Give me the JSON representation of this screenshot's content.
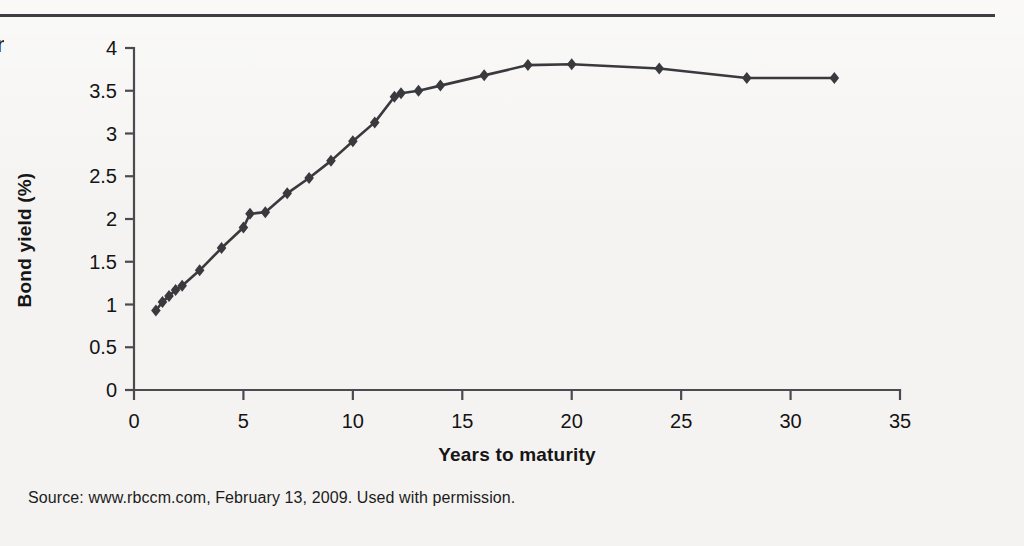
{
  "figure": {
    "margin_glyph": "n",
    "source_note": "Source: www.rbccm.com, February 13, 2009. Used with permission.",
    "rule_color": "#3d3d43",
    "background_color": "#f4f3f1"
  },
  "chart_data": {
    "type": "line",
    "title": "",
    "subtitle": "",
    "xlabel": "Years to maturity",
    "ylabel": "Bond yield (%)",
    "xlim": [
      0,
      35
    ],
    "ylim": [
      0,
      4
    ],
    "xticks": [
      0,
      5,
      10,
      15,
      20,
      25,
      30,
      35
    ],
    "xtick_labels": [
      "0",
      "5",
      "10",
      "15",
      "20",
      "25",
      "30",
      "35"
    ],
    "yticks": [
      0,
      0.5,
      1,
      1.5,
      2,
      2.5,
      3,
      3.5,
      4
    ],
    "ytick_labels": [
      "0",
      "0.5",
      "1",
      "1.5",
      "2",
      "2.5",
      "3",
      "3.5",
      "4"
    ],
    "grid": false,
    "legend": "none",
    "marker": "diamond",
    "marker_color": "#3a3a3e",
    "line_color": "#3a3a3e",
    "series": [
      {
        "name": "Bond yield curve",
        "x": [
          1.0,
          1.3,
          1.6,
          1.9,
          2.2,
          3.0,
          4.0,
          5.0,
          5.3,
          6.0,
          7.0,
          8.0,
          9.0,
          10.0,
          11.0,
          11.9,
          12.2,
          13.0,
          14.0,
          16.0,
          18.0,
          20.0,
          24.0,
          28.0,
          32.0
        ],
        "y": [
          0.93,
          1.03,
          1.1,
          1.17,
          1.22,
          1.4,
          1.66,
          1.9,
          2.06,
          2.08,
          2.3,
          2.48,
          2.68,
          2.91,
          3.13,
          3.43,
          3.47,
          3.5,
          3.56,
          3.68,
          3.8,
          3.81,
          3.76,
          3.65,
          3.65
        ]
      }
    ]
  }
}
